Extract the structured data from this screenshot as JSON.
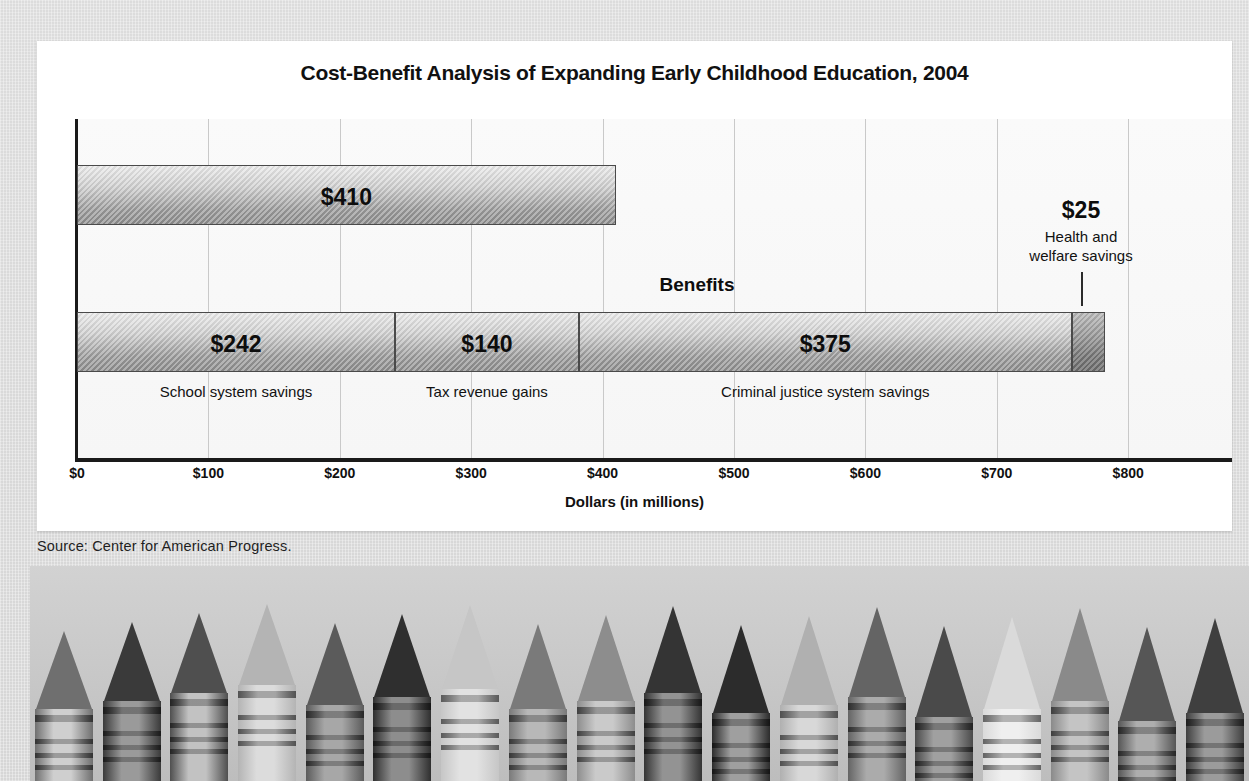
{
  "chart_data": {
    "type": "bar",
    "orientation": "horizontal",
    "title": "Cost-Benefit Analysis of Expanding Early Childhood Education, 2004",
    "xlabel": "Dollars (in millions)",
    "ylabel": "",
    "xlim": [
      0,
      800
    ],
    "grid": true,
    "legend": "none",
    "tick_labels": [
      "$0",
      "$100",
      "$200",
      "$300",
      "$400",
      "$500",
      "$600",
      "$700",
      "$800"
    ],
    "tick_values": [
      0,
      100,
      200,
      300,
      400,
      500,
      600,
      700,
      800
    ],
    "categories": [
      "Costs",
      "Benefits"
    ],
    "series": [
      {
        "name": "Costs",
        "label": "Costs",
        "total": 410,
        "segments": [
          {
            "label": "",
            "value": 410,
            "value_text": "$410"
          }
        ]
      },
      {
        "name": "Benefits",
        "label": "Benefits",
        "total": 782,
        "segments": [
          {
            "label": "School system savings",
            "value": 242,
            "value_text": "$242"
          },
          {
            "label": "Tax revenue gains",
            "value": 140,
            "value_text": "$140"
          },
          {
            "label": "Criminal justice system savings",
            "value": 375,
            "value_text": "$375"
          },
          {
            "label": "Health and welfare savings",
            "value": 25,
            "value_text": "$25"
          }
        ]
      }
    ],
    "annotations": [
      {
        "value_text": "$25",
        "line1": "Health and",
        "line2": "welfare savings",
        "target_value": 770
      }
    ],
    "colors": {
      "bar_light": "#e9e9e9",
      "bar_dark": "#8c8c8c",
      "bar_outline": "#4a4a4a",
      "gridline": "#c9c9c9",
      "axis": "#1a1a1a",
      "card_background": "#ffffff",
      "page_background": "#d8d8d8",
      "text": "#111111"
    }
  },
  "source": {
    "note": "Source: Center for American Progress."
  },
  "photo": {
    "caption": "",
    "subject": "row-of-crayon-tips"
  }
}
